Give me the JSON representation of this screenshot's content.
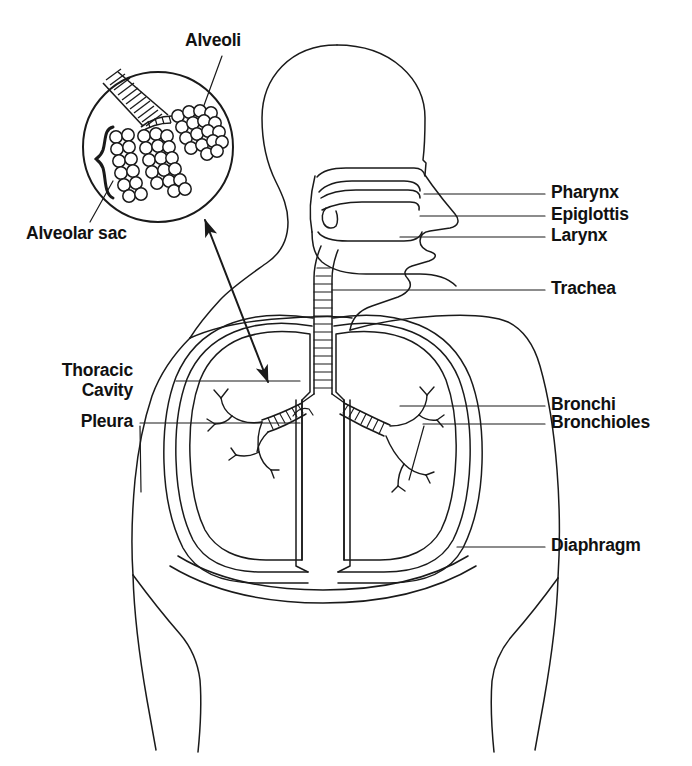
{
  "figure": {
    "line_color": "#1a1a1a",
    "text_color": "#111111",
    "background": "#ffffff"
  },
  "labels": {
    "alveoli": "Alveoli",
    "alveolar_sac": "Alveolar sac",
    "pharynx": "Pharynx",
    "epiglottis": "Epiglottis",
    "larynx": "Larynx",
    "trachea": "Trachea",
    "thoracic": "Thoracic",
    "cavity": "Cavity",
    "pleura": "Pleura",
    "bronchi": "Bronchi",
    "bronchioles": "Bronchioles",
    "diaphragm": "Diaphragm"
  },
  "parts": [
    {
      "name": "alveoli",
      "label": "Alveoli",
      "side": "top-left-inset"
    },
    {
      "name": "alveolar-sac",
      "label": "Alveolar sac",
      "side": "left-inset"
    },
    {
      "name": "pharynx",
      "label": "Pharynx",
      "side": "right"
    },
    {
      "name": "epiglottis",
      "label": "Epiglottis",
      "side": "right"
    },
    {
      "name": "larynx",
      "label": "Larynx",
      "side": "right"
    },
    {
      "name": "trachea",
      "label": "Trachea",
      "side": "right"
    },
    {
      "name": "bronchi",
      "label": "Bronchi",
      "side": "right"
    },
    {
      "name": "bronchioles",
      "label": "Bronchioles",
      "side": "right"
    },
    {
      "name": "diaphragm",
      "label": "Diaphragm",
      "side": "right"
    },
    {
      "name": "thoracic-cavity",
      "label": "Thoracic Cavity",
      "side": "left"
    },
    {
      "name": "pleura",
      "label": "Pleura",
      "side": "left"
    }
  ]
}
